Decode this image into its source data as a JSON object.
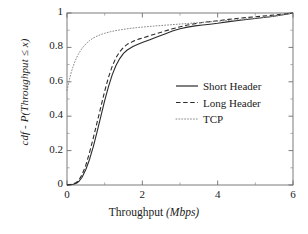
{
  "chart_data": {
    "type": "line",
    "title": "",
    "subtitle": "",
    "xlabel_main": "Throughput",
    "xlabel_unit": "(Mbps)",
    "xlabel": "Throughput (Mbps)",
    "ylabel": "cdf - P(Throughput ≤ x)",
    "xlim": [
      0,
      6
    ],
    "ylim": [
      0,
      1
    ],
    "grid": false,
    "legend_position": "center-right",
    "xticks": [
      0,
      2,
      4,
      6
    ],
    "xtick_labels": [
      "0",
      "2",
      "4",
      "6"
    ],
    "yticks": [
      0,
      0.2,
      0.4,
      0.6,
      0.8,
      1
    ],
    "ytick_labels": [
      "0",
      "0.2",
      "0.4",
      "0.6",
      "0.8",
      "1"
    ],
    "series": [
      {
        "name": "Short Header",
        "style": "solid",
        "color": "#2b2b2b",
        "x": [
          0.0,
          0.15,
          0.25,
          0.32,
          0.4,
          0.5,
          0.6,
          0.7,
          0.8,
          0.9,
          1.0,
          1.1,
          1.2,
          1.3,
          1.4,
          1.5,
          1.6,
          1.75,
          1.9,
          2.05,
          2.2,
          2.4,
          2.6,
          2.8,
          3.0,
          3.2,
          3.4,
          3.6,
          3.8,
          4.0,
          4.3,
          4.6,
          5.0,
          5.4,
          5.7,
          5.9,
          6.0
        ],
        "y": [
          0.0,
          0.003,
          0.01,
          0.022,
          0.045,
          0.09,
          0.15,
          0.225,
          0.31,
          0.4,
          0.49,
          0.57,
          0.64,
          0.695,
          0.735,
          0.765,
          0.785,
          0.805,
          0.82,
          0.833,
          0.845,
          0.862,
          0.878,
          0.895,
          0.908,
          0.918,
          0.925,
          0.93,
          0.935,
          0.94,
          0.95,
          0.958,
          0.968,
          0.978,
          0.988,
          0.996,
          1.0
        ]
      },
      {
        "name": "Long Header",
        "style": "dashed",
        "color": "#2b2b2b",
        "x": [
          0.0,
          0.15,
          0.25,
          0.32,
          0.4,
          0.5,
          0.6,
          0.7,
          0.8,
          0.9,
          1.0,
          1.1,
          1.2,
          1.3,
          1.4,
          1.5,
          1.6,
          1.75,
          1.9,
          2.05,
          2.2,
          2.4,
          2.6,
          2.8,
          3.0,
          3.2,
          3.4,
          3.6,
          3.8,
          4.0,
          4.3,
          4.6,
          5.0,
          5.4,
          5.7,
          5.9,
          6.0
        ],
        "y": [
          0.0,
          0.005,
          0.015,
          0.03,
          0.06,
          0.115,
          0.19,
          0.275,
          0.365,
          0.455,
          0.545,
          0.625,
          0.69,
          0.74,
          0.775,
          0.8,
          0.818,
          0.835,
          0.848,
          0.858,
          0.868,
          0.882,
          0.895,
          0.908,
          0.92,
          0.93,
          0.938,
          0.945,
          0.95,
          0.955,
          0.963,
          0.97,
          0.978,
          0.986,
          0.993,
          0.998,
          1.0
        ]
      },
      {
        "name": "TCP",
        "style": "dotted",
        "color": "#8a8a8a",
        "x": [
          0.0,
          0.05,
          0.1,
          0.15,
          0.2,
          0.25,
          0.3,
          0.4,
          0.5,
          0.6,
          0.7,
          0.8,
          0.9,
          1.0,
          1.15,
          1.3,
          1.5,
          1.7,
          1.9,
          2.1,
          2.3,
          2.6,
          2.9,
          3.2,
          3.5,
          3.8,
          4.1,
          4.4,
          4.8,
          5.2,
          5.5,
          5.8,
          6.0
        ],
        "y": [
          0.55,
          0.6,
          0.645,
          0.682,
          0.712,
          0.738,
          0.76,
          0.795,
          0.82,
          0.84,
          0.855,
          0.866,
          0.875,
          0.882,
          0.891,
          0.898,
          0.905,
          0.911,
          0.916,
          0.92,
          0.924,
          0.929,
          0.934,
          0.939,
          0.944,
          0.949,
          0.954,
          0.959,
          0.966,
          0.974,
          0.981,
          0.993,
          1.0
        ]
      }
    ],
    "legend": [
      {
        "label": "Short Header",
        "style": "solid"
      },
      {
        "label": "Long Header",
        "style": "dashed"
      },
      {
        "label": "TCP",
        "style": "dotted"
      }
    ]
  }
}
